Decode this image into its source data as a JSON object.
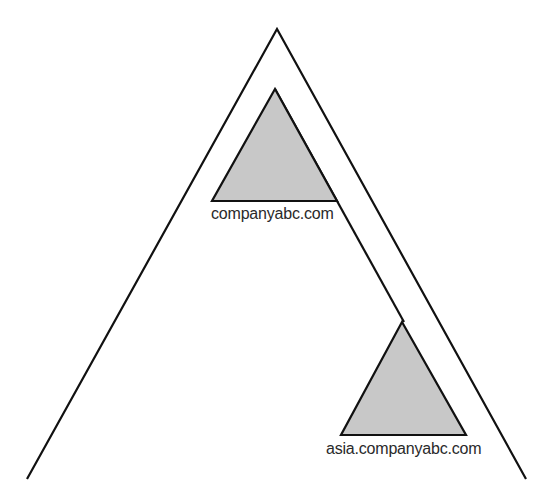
{
  "diagram": {
    "type": "domain-tree",
    "outer_triangle": {
      "name": "forest",
      "apex": [
        277,
        29
      ],
      "left_base": [
        27,
        479
      ],
      "right_base": [
        526,
        479
      ]
    },
    "inner_line": {
      "from": [
        275,
        89
      ],
      "to": [
        404,
        322
      ]
    },
    "domains": [
      {
        "label": "companyabc.com",
        "role": "root-domain",
        "apex": [
          275,
          89
        ],
        "base_left": [
          212,
          201
        ],
        "base_right": [
          337,
          201
        ],
        "fill": "#c8c8c8"
      },
      {
        "label": "asia.companyabc.com",
        "role": "child-domain",
        "apex": [
          402,
          322
        ],
        "base_left": [
          341,
          435
        ],
        "base_right": [
          466,
          435
        ],
        "fill": "#c8c8c8"
      }
    ],
    "colors": {
      "stroke": "#111111",
      "fill": "#c8c8c8",
      "background": "#ffffff",
      "text": "#2a2a2a"
    }
  }
}
